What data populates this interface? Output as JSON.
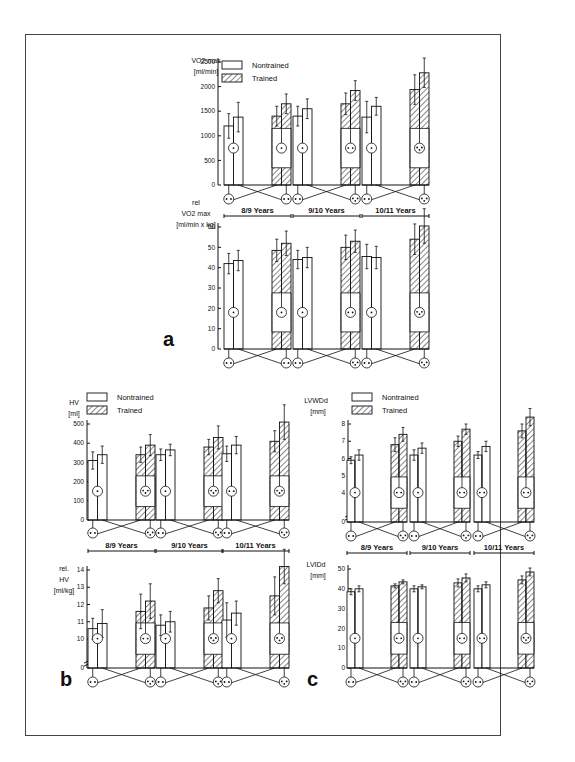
{
  "legend": {
    "nontrained": "Nontrained",
    "trained": "Trained"
  },
  "colors": {
    "ink": "#111111",
    "background": "#ffffff",
    "frame": "#444444"
  },
  "chart_data": [
    {
      "id": "a_top",
      "panel": "a",
      "type": "bar",
      "ylabel_lines": [
        "VO2 max",
        "[ml/min]"
      ],
      "ylim": [
        0,
        2500
      ],
      "yticks": [
        0,
        500,
        1000,
        1500,
        2000,
        2500
      ],
      "groups": [
        "8/9 Years",
        "9/10 Years",
        "10/11 Years"
      ],
      "series": [
        {
          "name": "Nontrained",
          "pairs": [
            [
              1200,
              1380
            ],
            [
              1400,
              1550
            ],
            [
              1380,
              1600
            ]
          ],
          "errors": [
            [
              250,
              300
            ],
            [
              200,
              200
            ],
            [
              320,
              180
            ]
          ]
        },
        {
          "name": "Trained",
          "pairs": [
            [
              1400,
              1650
            ],
            [
              1650,
              1920
            ],
            [
              1940,
              2280
            ]
          ],
          "errors": [
            [
              200,
              200
            ],
            [
              220,
              200
            ],
            [
              300,
              300
            ]
          ]
        }
      ],
      "face_dots": {
        "nontrained": [
          1,
          1,
          1
        ],
        "trained": [
          1,
          2,
          3
        ]
      }
    },
    {
      "id": "a_bottom",
      "panel": "a",
      "type": "bar",
      "ylabel_lines": [
        "rel",
        "VO2 max",
        "[ml/min x kg]"
      ],
      "ylim": [
        0,
        60
      ],
      "yticks": [
        0,
        10,
        20,
        30,
        40,
        50,
        60
      ],
      "groups": [
        "8/9 Years",
        "9/10 Years",
        "10/11 Years"
      ],
      "series": [
        {
          "name": "Nontrained",
          "pairs": [
            [
              42,
              43.5
            ],
            [
              44,
              45
            ],
            [
              45.5,
              45
            ]
          ],
          "errors": [
            [
              5,
              5
            ],
            [
              4.5,
              5
            ],
            [
              6,
              5.5
            ]
          ]
        },
        {
          "name": "Trained",
          "pairs": [
            [
              48.5,
              52
            ],
            [
              50,
              53
            ],
            [
              54,
              60.5
            ]
          ],
          "errors": [
            [
              5.5,
              6
            ],
            [
              6,
              5.5
            ],
            [
              7.5,
              8.5
            ]
          ]
        }
      ],
      "face_dots": {
        "nontrained": [
          1,
          1,
          1
        ],
        "trained": [
          1,
          2,
          3
        ]
      }
    },
    {
      "id": "b_top",
      "panel": "b",
      "type": "bar",
      "ylabel_lines": [
        "HV",
        "[ml]"
      ],
      "ylim": [
        0,
        500
      ],
      "yticks": [
        0,
        100,
        200,
        300,
        400,
        500
      ],
      "groups": [
        "8/9 Years",
        "9/10 Years",
        "10/11 Years"
      ],
      "series": [
        {
          "name": "Nontrained",
          "pairs": [
            [
              310,
              340
            ],
            [
              340,
              365
            ],
            [
              345,
              390
            ]
          ],
          "errors": [
            [
              45,
              45
            ],
            [
              30,
              30
            ],
            [
              40,
              45
            ]
          ]
        },
        {
          "name": "Trained",
          "pairs": [
            [
              340,
              390
            ],
            [
              380,
              430
            ],
            [
              410,
              510
            ]
          ],
          "errors": [
            [
              40,
              55
            ],
            [
              40,
              60
            ],
            [
              55,
              90
            ]
          ]
        }
      ],
      "face_dots": {
        "nontrained": [
          1,
          1,
          2
        ],
        "trained": [
          3,
          3,
          3
        ]
      }
    },
    {
      "id": "b_bottom",
      "panel": "b",
      "type": "bar",
      "ylabel_lines": [
        "rel.",
        "HV",
        "[ml/kg]"
      ],
      "ylim": [
        9,
        14
      ],
      "axis_break": true,
      "yticks": [
        0,
        10,
        11,
        12,
        13,
        14
      ],
      "groups": [
        "8/9 Years",
        "9/10 Years",
        "10/11 Years"
      ],
      "series": [
        {
          "name": "Nontrained",
          "pairs": [
            [
              10.6,
              10.9
            ],
            [
              10.8,
              11.0
            ],
            [
              11.1,
              11.5
            ]
          ],
          "errors": [
            [
              0.6,
              0.8
            ],
            [
              0.6,
              0.6
            ],
            [
              1.0,
              0.7
            ]
          ]
        },
        {
          "name": "Trained",
          "pairs": [
            [
              11.6,
              12.2
            ],
            [
              11.8,
              12.8
            ],
            [
              12.5,
              14.2
            ]
          ],
          "errors": [
            [
              1.0,
              1.0
            ],
            [
              0.7,
              0.7
            ],
            [
              1.1,
              1.0
            ]
          ]
        }
      ],
      "face_dots": {
        "nontrained": [
          1,
          1,
          1
        ],
        "trained": [
          2,
          3,
          3
        ]
      }
    },
    {
      "id": "c_top",
      "panel": "c",
      "type": "bar",
      "ylabel_lines": [
        "LVWDd",
        "[mm]"
      ],
      "ylim": [
        3,
        8
      ],
      "axis_break": true,
      "yticks": [
        0,
        4,
        5,
        6,
        7,
        8
      ],
      "groups": [
        "8/9 Years",
        "9/10 Years",
        "10/11 Years"
      ],
      "series": [
        {
          "name": "Nontrained",
          "pairs": [
            [
              5.9,
              6.2
            ],
            [
              6.2,
              6.6
            ],
            [
              6.2,
              6.7
            ]
          ],
          "errors": [
            [
              0.2,
              0.3
            ],
            [
              0.3,
              0.3
            ],
            [
              0.2,
              0.3
            ]
          ]
        },
        {
          "name": "Trained",
          "pairs": [
            [
              6.8,
              7.4
            ],
            [
              7.0,
              7.7
            ],
            [
              7.6,
              8.4
            ]
          ],
          "errors": [
            [
              0.4,
              0.4
            ],
            [
              0.3,
              0.3
            ],
            [
              0.4,
              0.5
            ]
          ]
        }
      ],
      "face_dots": {
        "nontrained": [
          1,
          1,
          2
        ],
        "trained": [
          2,
          2,
          2
        ]
      }
    },
    {
      "id": "c_bottom",
      "panel": "c",
      "type": "bar",
      "ylabel_lines": [
        "LVIDd",
        "[mm]"
      ],
      "ylim": [
        0,
        50
      ],
      "yticks": [
        0,
        10,
        20,
        30,
        40,
        50
      ],
      "groups": [
        "8/9 Years",
        "9/10 Years",
        "10/11 Years"
      ],
      "series": [
        {
          "name": "Nontrained",
          "pairs": [
            [
              38.5,
              40
            ],
            [
              40,
              41
            ],
            [
              40,
              42
            ]
          ],
          "errors": [
            [
              1.5,
              1.5
            ],
            [
              1.5,
              1
            ],
            [
              1.5,
              1.5
            ]
          ]
        },
        {
          "name": "Trained",
          "pairs": [
            [
              41.5,
              43.5
            ],
            [
              43,
              45.5
            ],
            [
              44.5,
              48.5
            ]
          ],
          "errors": [
            [
              1,
              1
            ],
            [
              2,
              2
            ],
            [
              2,
              2
            ]
          ]
        }
      ],
      "face_dots": {
        "nontrained": [
          1,
          1,
          2
        ],
        "trained": [
          2,
          2,
          3
        ]
      }
    }
  ],
  "panel_labels": {
    "a": "a",
    "b": "b",
    "c": "c"
  }
}
